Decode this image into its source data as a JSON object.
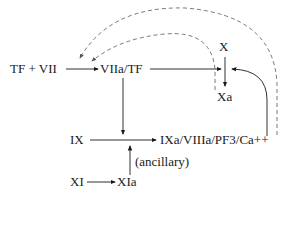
{
  "diagram": {
    "type": "coagulation-pathway",
    "nodes": {
      "tf_vii": "TF + VII",
      "viia_tf": "VIIa/TF",
      "x": "X",
      "xa": "Xa",
      "ix": "IX",
      "ixa_complex": "IXa/VIIIa/PF3/Ca++",
      "xi": "XI",
      "xia": "XIa",
      "ancillary": "(ancillary)"
    },
    "edges": [
      {
        "from": "TF + VII",
        "to": "VIIa/TF",
        "style": "solid"
      },
      {
        "from": "VIIa/TF",
        "to": "X→Xa",
        "style": "solid"
      },
      {
        "from": "X",
        "to": "Xa",
        "style": "solid"
      },
      {
        "from": "VIIa/TF",
        "to": "IX→IXa",
        "style": "solid"
      },
      {
        "from": "IX",
        "to": "IXa/VIIIa/PF3/Ca++",
        "style": "solid"
      },
      {
        "from": "XI",
        "to": "XIa",
        "style": "solid"
      },
      {
        "from": "XIa",
        "to": "IX→IXa",
        "style": "solid",
        "label": "(ancillary)"
      },
      {
        "from": "IXa/VIIIa/PF3/Ca++",
        "to": "X→Xa",
        "style": "solid"
      },
      {
        "from": "Xa",
        "to": "VIIa/TF",
        "style": "dashed"
      },
      {
        "from": "IXa/VIIIa/PF3/Ca++",
        "to": "TF + VII",
        "style": "dashed"
      }
    ]
  }
}
